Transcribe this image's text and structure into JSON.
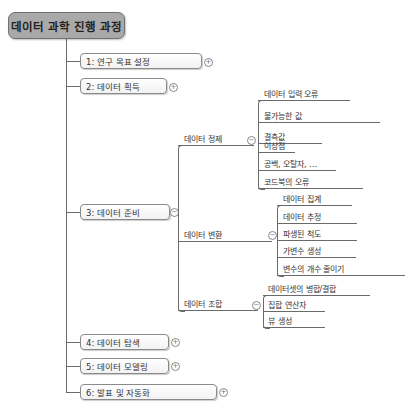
{
  "root": {
    "label": "데이터 과학 진행 과정"
  },
  "topics": [
    {
      "label": "1: 연구 목표 설정",
      "toggle": "+"
    },
    {
      "label": "2: 데이터 획득",
      "toggle": "+"
    },
    {
      "label": "3: 데이터 준비",
      "toggle": "−"
    },
    {
      "label": "4: 데이터 탐색",
      "toggle": "+"
    },
    {
      "label": "5: 데이터 모델링",
      "toggle": "+"
    },
    {
      "label": "6: 발표 및 자동화",
      "toggle": "+"
    }
  ],
  "preparation": {
    "groups": [
      {
        "label": "데이터 정제",
        "toggle": "−",
        "items": [
          "데이터 입력 오류",
          "불가능한 값",
          "결측값",
          "이상점",
          "공백, 오탈자, …",
          "코드북의 오류"
        ]
      },
      {
        "label": "데이터 변환",
        "toggle": "−",
        "items": [
          "데이터 집계",
          "데이터 추정",
          "파생된 척도",
          "가변수 생성",
          "변수의 개수 줄이기"
        ]
      },
      {
        "label": "데이터 조합",
        "toggle": "−",
        "items": [
          "데이터셋의 병합/결합",
          "집합 연산자",
          "뷰 생성"
        ]
      }
    ]
  },
  "colors": {
    "root_fill": "#a9a9a9",
    "line": "#6a6a6a",
    "box_border": "#8a8a8a"
  }
}
